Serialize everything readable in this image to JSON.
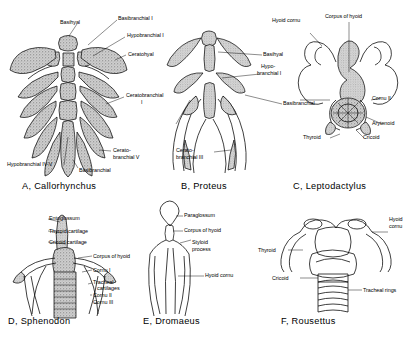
{
  "plate": {
    "title": "Comparative hyoid and branchial skeleton plate",
    "background": "#ffffff",
    "ink": "#000000",
    "stipple_fill": "#b9b9b9"
  },
  "figures": [
    {
      "key": "A",
      "letter": "A,",
      "taxon": "Callorhynchus",
      "caption": "A,  Callorhynchus",
      "labels": [
        {
          "name": "basihyal",
          "text": "Basihyal"
        },
        {
          "name": "basibranchial-i",
          "text": "Basibranchial I"
        },
        {
          "name": "hypobranchial-i",
          "text": "Hypobranchial I"
        },
        {
          "name": "ceratohyal",
          "text": "Ceratohyal"
        },
        {
          "name": "ceratobranchial-i",
          "text": "Ceratobranchial"
        },
        {
          "name": "ceratobranchial-i-numeral",
          "text": "I"
        },
        {
          "name": "ceratobranchial-v-line1",
          "text": "Cerato-"
        },
        {
          "name": "ceratobranchial-v-line2",
          "text": "branchial V"
        },
        {
          "name": "hypobranchial-iv-v",
          "text": "Hypobranchial IV-V"
        },
        {
          "name": "basibranchial",
          "text": "Basibranchial"
        }
      ]
    },
    {
      "key": "B",
      "letter": "B,",
      "taxon": "Proteus",
      "caption": "B,  Proteus",
      "labels": [
        {
          "name": "basihyal",
          "text": "Basihyal"
        },
        {
          "name": "hypobranchial-i-line1",
          "text": "Hypo-"
        },
        {
          "name": "hypobranchial-i-line2",
          "text": "branchial I"
        },
        {
          "name": "basibranchial",
          "text": "Basibranchial"
        },
        {
          "name": "ceratobranchial-iii-line1",
          "text": "Cerato-"
        },
        {
          "name": "ceratobranchial-iii-line2",
          "text": "branchial III"
        }
      ]
    },
    {
      "key": "C",
      "letter": "C,",
      "taxon": "Leptodactylus",
      "caption": "C,  Leptodactylus",
      "labels": [
        {
          "name": "hyoid-cornu",
          "text": "Hyoid cornu"
        },
        {
          "name": "corpus-of-hyoid",
          "text": "Corpus of hyoid"
        },
        {
          "name": "cornu-ii",
          "text": "Cornu II"
        },
        {
          "name": "arytenoid",
          "text": "Arytenoid"
        },
        {
          "name": "thyroid",
          "text": "Thyroid"
        },
        {
          "name": "cricoid",
          "text": "Cricoid"
        }
      ]
    },
    {
      "key": "D",
      "letter": "D,",
      "taxon": "Sphenodon",
      "caption": "D,  Sphenodon",
      "labels": [
        {
          "name": "entoglossum",
          "text": "Entoglossum"
        },
        {
          "name": "thyroid-cartilage",
          "text": "Thyroid cartilage"
        },
        {
          "name": "cricoid-cartilage",
          "text": "Cricoid cartilage"
        },
        {
          "name": "corpus-of-hyoid",
          "text": "Corpus of hyoid"
        },
        {
          "name": "cornu-i",
          "text": "Cornu I"
        },
        {
          "name": "tracheal-cartilages-line1",
          "text": "Tracheal"
        },
        {
          "name": "tracheal-cartilages-line2",
          "text": "cartilages"
        },
        {
          "name": "cornu-ii",
          "text": "Cornu II"
        },
        {
          "name": "cornu-iii",
          "text": "Cornu III"
        }
      ]
    },
    {
      "key": "E",
      "letter": "E,",
      "taxon": "Dromaeus",
      "caption": "E, Dromaeus",
      "labels": [
        {
          "name": "paraglossum",
          "text": "Paraglossum"
        },
        {
          "name": "corpus-of-hyoid",
          "text": "Corpus of hyoid"
        },
        {
          "name": "styloid-process-line1",
          "text": "Styloid"
        },
        {
          "name": "styloid-process-line2",
          "text": "process"
        },
        {
          "name": "hyoid-cornu",
          "text": "Hyoid cornu"
        }
      ]
    },
    {
      "key": "F",
      "letter": "F,",
      "taxon": "Rousettus",
      "caption": "F,  Rousettus",
      "labels": [
        {
          "name": "hyoid-cornu-line1",
          "text": "Hyoid"
        },
        {
          "name": "hyoid-cornu-line2",
          "text": "cornu"
        },
        {
          "name": "thyroid",
          "text": "Thyroid"
        },
        {
          "name": "cricoid",
          "text": "Cricoid"
        },
        {
          "name": "tracheal-rings",
          "text": "Tracheal rings"
        }
      ]
    }
  ]
}
